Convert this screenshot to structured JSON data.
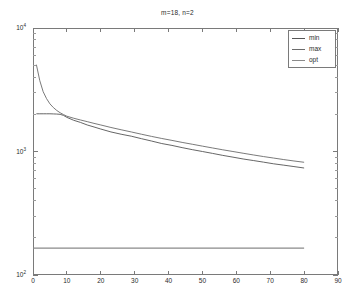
{
  "chart_data": {
    "type": "line",
    "title": "m=18, n=2",
    "xlabel": "",
    "ylabel": "",
    "xlim": [
      0,
      90
    ],
    "ylim": [
      100,
      10000
    ],
    "yscale": "log",
    "xscale": "linear",
    "grid": false,
    "legend_position": "top-right",
    "xticks": [
      0,
      10,
      20,
      30,
      40,
      50,
      60,
      70,
      80,
      90
    ],
    "xticklabels": [
      "0",
      "10",
      "20",
      "30",
      "40",
      "50",
      "60",
      "70",
      "80",
      "90"
    ],
    "yticks": [
      100,
      1000,
      10000
    ],
    "yticklabels": [
      "10",
      "10",
      "10"
    ],
    "yticklabel_exponents": [
      "2",
      "3",
      "4"
    ],
    "series": [
      {
        "name": "min",
        "color": "#555555",
        "x": [
          1,
          2,
          3,
          4,
          5,
          6,
          7,
          8,
          9,
          10,
          12,
          14,
          16,
          18,
          20,
          23,
          26,
          29,
          32,
          35,
          38,
          41,
          44,
          47,
          50,
          53,
          56,
          59,
          62,
          65,
          68,
          71,
          74,
          77,
          80
        ],
        "y": [
          2020,
          2020,
          2020,
          2020,
          2020,
          2015,
          2010,
          2000,
          1960,
          1890,
          1790,
          1720,
          1640,
          1580,
          1520,
          1440,
          1380,
          1330,
          1270,
          1215,
          1160,
          1120,
          1075,
          1035,
          1000,
          965,
          930,
          900,
          870,
          845,
          820,
          795,
          775,
          755,
          735
        ]
      },
      {
        "name": "max",
        "color": "#6b6b6b",
        "x": [
          1,
          2,
          3,
          4,
          5,
          6,
          7,
          8,
          9,
          10,
          12,
          14,
          16,
          18,
          20,
          23,
          26,
          29,
          32,
          35,
          38,
          41,
          44,
          47,
          50,
          53,
          56,
          59,
          62,
          65,
          68,
          71,
          74,
          77,
          80
        ],
        "y": [
          5050,
          3750,
          3050,
          2680,
          2430,
          2270,
          2150,
          2060,
          1990,
          1930,
          1860,
          1800,
          1745,
          1690,
          1640,
          1565,
          1500,
          1440,
          1380,
          1325,
          1275,
          1230,
          1185,
          1145,
          1105,
          1068,
          1032,
          1000,
          968,
          938,
          910,
          885,
          860,
          838,
          818
        ]
      },
      {
        "name": "opt",
        "color": "#8a8a8a",
        "x": [
          0,
          80
        ],
        "y": [
          165,
          165
        ]
      }
    ],
    "legend": [
      "min",
      "max",
      "opt"
    ]
  },
  "legend": {
    "items": [
      {
        "label": "min"
      },
      {
        "label": "max"
      },
      {
        "label": "opt"
      }
    ]
  }
}
